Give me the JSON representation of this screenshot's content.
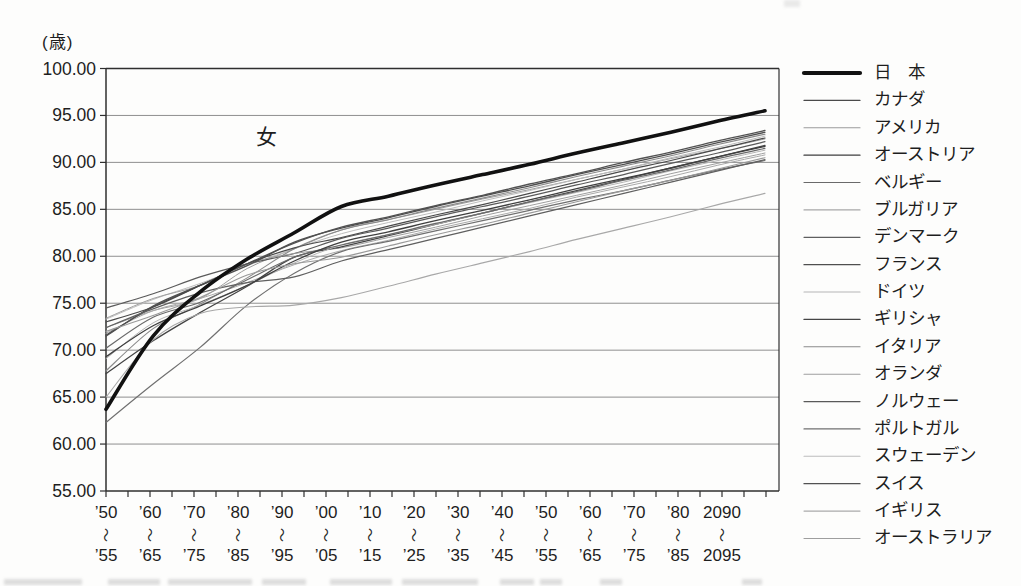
{
  "figure": {
    "unit_label": "(歳)",
    "annotation": "女"
  },
  "chart_data": {
    "type": "line",
    "title": "",
    "ylabel": "(歳)",
    "xlabel": "",
    "annotation": "女",
    "ylim": [
      55,
      100
    ],
    "ytick_step": 5,
    "ytick_labels": [
      "100.00",
      "95.00",
      "90.00",
      "85.00",
      "80.00",
      "75.00",
      "70.00",
      "65.00",
      "60.00",
      "55.00"
    ],
    "grid": true,
    "legend_position": "right",
    "range_separator": "〜",
    "frame_color": "#2f2f2f",
    "grid_color": "#8f8f8f",
    "categories": [
      {
        "top": "’50",
        "bottom": "’55"
      },
      {
        "top": "’60",
        "bottom": "’65"
      },
      {
        "top": "’70",
        "bottom": "’75"
      },
      {
        "top": "’80",
        "bottom": "’85"
      },
      {
        "top": "’90",
        "bottom": "’95"
      },
      {
        "top": "’00",
        "bottom": "’05"
      },
      {
        "top": "’10",
        "bottom": "’15"
      },
      {
        "top": "’20",
        "bottom": "’25"
      },
      {
        "top": "’30",
        "bottom": "’35"
      },
      {
        "top": "’40",
        "bottom": "’45"
      },
      {
        "top": "’50",
        "bottom": "’55"
      },
      {
        "top": "’60",
        "bottom": "’65"
      },
      {
        "top": "’70",
        "bottom": "’75"
      },
      {
        "top": "’80",
        "bottom": "’85"
      },
      {
        "top": "2090",
        "bottom": "2095"
      }
    ],
    "series": [
      {
        "id": "japan",
        "label": "日　本",
        "color": "#111111",
        "width": 3.6,
        "values": [
          63.7,
          71.5,
          76.2,
          79.7,
          82.5,
          85.3,
          86.4,
          87.6,
          88.7,
          89.8,
          91.0,
          92.1,
          93.2,
          94.4,
          95.5
        ]
      },
      {
        "id": "canada",
        "label": "カナダ",
        "color": "#4a4a4a",
        "width": 1.2,
        "values": [
          73.0,
          74.6,
          76.9,
          79.2,
          80.9,
          82.0,
          83.2,
          84.4,
          85.5,
          86.7,
          87.9,
          89.1,
          90.2,
          91.4,
          92.6
        ]
      },
      {
        "id": "usa",
        "label": "アメリカ",
        "color": "#9a9a9a",
        "width": 1.1,
        "values": [
          72.0,
          73.7,
          75.6,
          78.0,
          79.2,
          79.9,
          81.1,
          82.3,
          83.4,
          84.6,
          85.8,
          87.0,
          88.1,
          89.3,
          90.5
        ]
      },
      {
        "id": "austria",
        "label": "オーストリア",
        "color": "#3f3f3f",
        "width": 1.3,
        "values": [
          69.3,
          72.6,
          74.7,
          76.9,
          79.5,
          81.5,
          82.6,
          83.8,
          84.9,
          86.0,
          87.2,
          88.3,
          89.4,
          90.6,
          91.7
        ]
      },
      {
        "id": "belgium",
        "label": "ベルギー",
        "color": "#6a6a6a",
        "width": 1.2,
        "values": [
          70.2,
          73.5,
          75.1,
          77.5,
          79.9,
          81.2,
          82.3,
          83.5,
          84.6,
          85.8,
          86.9,
          88.1,
          89.2,
          90.4,
          91.5
        ]
      },
      {
        "id": "bulgaria",
        "label": "ブルガリア",
        "color": "#a8a8a8",
        "width": 1.1,
        "values": [
          65.0,
          71.1,
          73.9,
          74.6,
          74.8,
          75.6,
          76.8,
          78.1,
          79.3,
          80.5,
          81.8,
          83.0,
          84.2,
          85.5,
          86.7
        ]
      },
      {
        "id": "denmark",
        "label": "デンマーク",
        "color": "#5f5f5f",
        "width": 1.2,
        "values": [
          72.4,
          74.4,
          76.1,
          77.2,
          77.8,
          79.5,
          80.7,
          81.9,
          83.1,
          84.3,
          85.5,
          86.7,
          87.9,
          89.1,
          90.3
        ]
      },
      {
        "id": "france",
        "label": "フランス",
        "color": "#4f4f4f",
        "width": 1.3,
        "values": [
          71.5,
          74.7,
          76.9,
          79.0,
          81.5,
          83.0,
          84.1,
          85.3,
          86.4,
          87.5,
          88.7,
          89.8,
          90.9,
          92.1,
          93.2
        ]
      },
      {
        "id": "germany",
        "label": "ドイツ",
        "color": "#b5b5b5",
        "width": 1.0,
        "values": [
          69.1,
          72.9,
          74.8,
          76.9,
          79.3,
          81.2,
          82.3,
          83.4,
          84.6,
          85.7,
          86.8,
          87.9,
          89.1,
          90.2,
          91.3
        ]
      },
      {
        "id": "greece",
        "label": "ギリシャ",
        "color": "#454545",
        "width": 1.3,
        "values": [
          67.5,
          71.0,
          74.0,
          76.8,
          79.9,
          81.0,
          82.2,
          83.4,
          84.6,
          85.8,
          87.0,
          88.2,
          89.4,
          90.6,
          91.8
        ]
      },
      {
        "id": "italy",
        "label": "イタリア",
        "color": "#8a8a8a",
        "width": 1.1,
        "values": [
          67.8,
          72.3,
          74.9,
          77.7,
          80.8,
          82.8,
          83.9,
          85.1,
          86.2,
          87.3,
          88.5,
          89.6,
          90.7,
          91.9,
          93.0
        ]
      },
      {
        "id": "netherlands",
        "label": "オランダ",
        "color": "#9f9f9f",
        "width": 1.0,
        "values": [
          73.4,
          75.5,
          76.9,
          79.2,
          80.3,
          80.9,
          82.0,
          83.1,
          84.3,
          85.4,
          86.5,
          87.6,
          88.8,
          89.9,
          91.0
        ]
      },
      {
        "id": "norway",
        "label": "ノルウェー",
        "color": "#5a5a5a",
        "width": 1.2,
        "values": [
          74.5,
          76.0,
          77.8,
          79.2,
          80.3,
          81.9,
          83.0,
          84.2,
          85.3,
          86.4,
          87.6,
          88.7,
          89.9,
          91.0,
          92.2
        ]
      },
      {
        "id": "portugal",
        "label": "ポルトガル",
        "color": "#707070",
        "width": 1.2,
        "values": [
          62.3,
          66.4,
          70.3,
          74.8,
          78.2,
          80.5,
          81.6,
          82.7,
          83.8,
          84.9,
          86.0,
          87.0,
          88.1,
          89.2,
          90.2
        ]
      },
      {
        "id": "sweden",
        "label": "スウェーデン",
        "color": "#bdbdbd",
        "width": 1.0,
        "values": [
          73.3,
          75.4,
          77.1,
          79.0,
          80.8,
          82.4,
          83.6,
          84.7,
          85.9,
          87.0,
          88.2,
          89.3,
          90.5,
          91.6,
          92.8
        ]
      },
      {
        "id": "switzerland",
        "label": "スイス",
        "color": "#525252",
        "width": 1.3,
        "values": [
          71.6,
          74.6,
          76.9,
          79.2,
          81.4,
          83.1,
          84.2,
          85.4,
          86.5,
          87.7,
          88.8,
          90.0,
          91.1,
          92.3,
          93.4
        ]
      },
      {
        "id": "uk",
        "label": "イギリス",
        "color": "#aaaaaa",
        "width": 1.0,
        "values": [
          71.8,
          74.2,
          75.5,
          77.2,
          79.1,
          80.6,
          81.7,
          82.9,
          84.0,
          85.1,
          86.3,
          87.4,
          88.5,
          89.7,
          90.8
        ]
      },
      {
        "id": "australia",
        "label": "オーストラリア",
        "color": "#9e9e9e",
        "width": 1.0,
        "values": [
          72.4,
          74.2,
          75.5,
          78.7,
          80.8,
          82.8,
          83.9,
          85.0,
          86.1,
          87.1,
          88.2,
          89.3,
          90.4,
          91.4,
          92.5
        ]
      }
    ]
  }
}
